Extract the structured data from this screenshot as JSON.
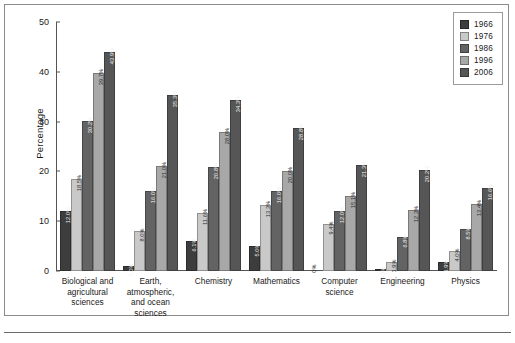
{
  "chart_data": {
    "type": "bar",
    "title": "",
    "xlabel": "",
    "ylabel": "Percentage",
    "ylim": [
      0,
      50
    ],
    "yticks": [
      0,
      10,
      20,
      30,
      40,
      50
    ],
    "grid": false,
    "legend_position": "top-right",
    "categories": [
      "Biological and agricultural sciences",
      "Earth, atmospheric, and ocean sciences",
      "Chemistry",
      "Mathematics",
      "Computer science",
      "Engineering",
      "Physics"
    ],
    "series": [
      {
        "name": "1966",
        "color": "#3d3d3d",
        "values": [
          12.0,
          1.0,
          6.1,
          5.0,
          0.0,
          0.3,
          1.9
        ]
      },
      {
        "name": "1976",
        "color": "#c9c9c9",
        "values": [
          18.5,
          8.0,
          11.6,
          13.3,
          9.4,
          1.9,
          4.0
        ]
      },
      {
        "name": "1986",
        "color": "#636363",
        "values": [
          30.2,
          16.0,
          20.8,
          16.0,
          12.0,
          6.8,
          8.5
        ]
      },
      {
        "name": "1996",
        "color": "#a8a8a8",
        "values": [
          39.7,
          21.0,
          28.0,
          20.0,
          15.1,
          12.3,
          13.4
        ]
      },
      {
        "name": "2006",
        "color": "#565656",
        "values": [
          43.9,
          35.3,
          34.3,
          28.8,
          21.3,
          20.2,
          16.6
        ]
      }
    ],
    "value_labels": [
      [
        "12.0%",
        "18.5%",
        "30.2%",
        "39.7%",
        "43.9%"
      ],
      [
        "1.0%",
        "8.0%",
        "16.0%",
        "21.0%",
        "35.3%"
      ],
      [
        "6.1%",
        "11.6%",
        "20.8%",
        "28.0%",
        "34.3%"
      ],
      [
        "5.0%",
        "13.3%",
        "16.0%",
        "20.0%",
        "28.8%"
      ],
      [
        "0%",
        "9.4%",
        "12.0%",
        "15.1%",
        "21.3%"
      ],
      [
        "0.3%",
        "1.9%",
        "6.8%",
        "12.3%",
        "20.2%"
      ],
      [
        "1.9%",
        "4.0%",
        "8.5%",
        "13.4%",
        "16.6%"
      ]
    ]
  },
  "legend": {
    "items": [
      {
        "label": "1966",
        "color": "#3d3d3d"
      },
      {
        "label": "1976",
        "color": "#c9c9c9"
      },
      {
        "label": "1986",
        "color": "#636363"
      },
      {
        "label": "1996",
        "color": "#a8a8a8"
      },
      {
        "label": "2006",
        "color": "#565656"
      }
    ]
  }
}
